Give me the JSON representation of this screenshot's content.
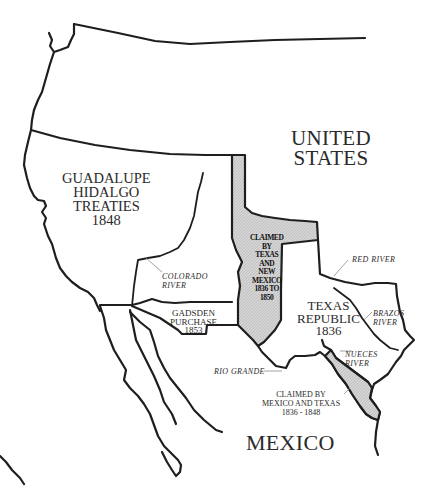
{
  "map": {
    "title": "Territorial claims: Texas, Mexico and the United States",
    "colors": {
      "background": "#ffffff",
      "border": "#1e1e1e",
      "claimed_fill": "#cfcfcf",
      "text": "#2a2a2a"
    },
    "regions": {
      "united_states": {
        "line1": "UNITED",
        "line2": "STATES"
      },
      "guadalupe": {
        "line1": "GUADALUPE",
        "line2": "HIDALGO",
        "line3": "TREATIES",
        "line4": "1848"
      },
      "texas_republic": {
        "line1": "TEXAS",
        "line2": "REPUBLIC",
        "line3": "1836"
      },
      "gadsden": {
        "line1": "GADSDEN",
        "line2": "PURCHASE",
        "line3": "1853"
      },
      "mexico": {
        "label": "MEXICO"
      },
      "claimed_tx_nm": {
        "line1": "CLAIMED",
        "line2": "BY",
        "line3": "TEXAS",
        "line4": "AND",
        "line5": "NEW",
        "line6": "MEXICO",
        "line7": "1836 TO",
        "line8": "1850"
      },
      "claimed_mx_tx": {
        "line1": "CLAIMED BY",
        "line2": "MEXICO AND TEXAS",
        "line3": "1836 - 1848"
      }
    },
    "rivers": {
      "colorado": {
        "line1": "COLORADO",
        "line2": "RIVER"
      },
      "red": {
        "label": "RED RIVER"
      },
      "brazos": {
        "line1": "BRAZOS",
        "line2": "RIVER"
      },
      "nueces": {
        "line1": "NUECES",
        "line2": "RIVER"
      },
      "rio_grande": {
        "label": "RIO GRANDE"
      }
    }
  }
}
